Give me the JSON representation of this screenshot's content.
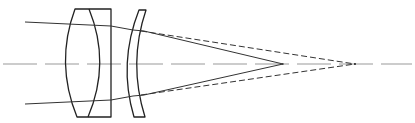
{
  "diagram": {
    "type": "optical-ray-diagram",
    "colors": {
      "background": "#ffffff",
      "lens_stroke": "#222222",
      "ray_stroke": "#333333",
      "axis_stroke": "#999999"
    },
    "elements": [
      {
        "id": "optical-axis",
        "kind": "dashed-line",
        "y": 64,
        "x_start": 3,
        "x_end": 412
      },
      {
        "id": "cemented-doublet",
        "kind": "lens",
        "x_range": [
          65,
          111
        ],
        "y_range": [
          9,
          117
        ]
      },
      {
        "id": "meniscus-lens",
        "kind": "lens",
        "x_range": [
          128,
          146
        ],
        "y_range": [
          10,
          117
        ]
      },
      {
        "id": "upper-ray",
        "kind": "solid",
        "focus": [
          283,
          64
        ]
      },
      {
        "id": "lower-ray",
        "kind": "solid",
        "focus": [
          283,
          64
        ]
      },
      {
        "id": "upper-ray-dashed",
        "kind": "dashed",
        "focus": [
          355,
          64
        ]
      },
      {
        "id": "lower-ray-dashed",
        "kind": "dashed",
        "focus": [
          355,
          64
        ]
      }
    ],
    "focal_points": {
      "solid": {
        "x": 283,
        "y": 64
      },
      "dashed": {
        "x": 355,
        "y": 64
      }
    }
  }
}
